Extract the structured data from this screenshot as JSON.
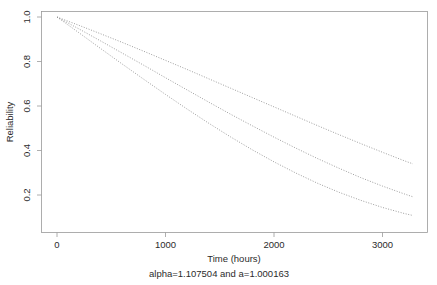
{
  "chart_data": {
    "type": "line",
    "title": "",
    "subtitle": "",
    "xlabel": "Time (hours)",
    "ylabel": "Reliability",
    "caption": "alpha=1.107504 and a=1.000163",
    "xlim": [
      -110,
      3390
    ],
    "ylim": [
      0.06,
      1.035
    ],
    "grid": false,
    "legend": false,
    "legend_position": "none",
    "line_style": "dotted",
    "line_color": "#8c8c8c",
    "xticks": [
      0,
      1000,
      2000,
      3000
    ],
    "xtick_labels": [
      "0",
      "1000",
      "2000",
      "3000"
    ],
    "yticks": [
      0.2,
      0.4,
      0.6,
      0.8,
      1.0
    ],
    "ytick_labels": [
      "0.2",
      "0.4",
      "0.6",
      "0.8",
      "1.0"
    ],
    "ytick_rotation": 90,
    "x": [
      0,
      200,
      400,
      600,
      800,
      1000,
      1200,
      1400,
      1600,
      1800,
      2000,
      2200,
      2400,
      2600,
      2800,
      3000,
      3200,
      3280
    ],
    "series": [
      {
        "name": "upper-confidence-bound",
        "values": [
          1.0,
          0.963,
          0.925,
          0.886,
          0.846,
          0.805,
          0.764,
          0.722,
          0.68,
          0.638,
          0.596,
          0.554,
          0.512,
          0.471,
          0.431,
          0.392,
          0.354,
          0.34
        ]
      },
      {
        "name": "reliability-estimate",
        "values": [
          1.0,
          0.947,
          0.893,
          0.838,
          0.783,
          0.727,
          0.672,
          0.617,
          0.563,
          0.511,
          0.46,
          0.411,
          0.364,
          0.32,
          0.278,
          0.24,
          0.205,
          0.192
        ]
      },
      {
        "name": "lower-confidence-bound",
        "values": [
          1.0,
          0.93,
          0.859,
          0.789,
          0.72,
          0.652,
          0.586,
          0.522,
          0.461,
          0.403,
          0.349,
          0.299,
          0.253,
          0.212,
          0.176,
          0.144,
          0.117,
          0.108
        ]
      }
    ]
  },
  "axes": {
    "y_axis_label": "Reliability",
    "x_axis_label": "Time (hours)"
  },
  "caption": {
    "text": "alpha=1.107504 and a=1.000163"
  }
}
